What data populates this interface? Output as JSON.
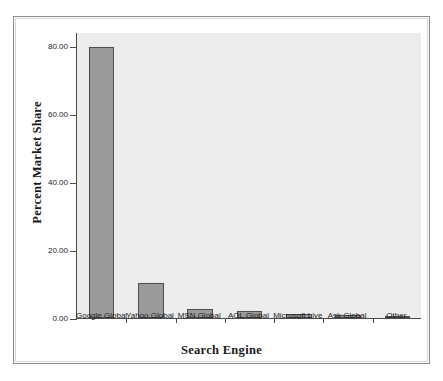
{
  "chart_data": {
    "type": "bar",
    "title": "",
    "xlabel": "Search Engine",
    "ylabel": "Percent Market Share",
    "categories": [
      "Google Global",
      "Yahoo Global",
      "MSN Global",
      "AOL Global",
      "Microsoft Live",
      "Ask Global",
      "Other"
    ],
    "values": [
      79.6,
      10.4,
      2.7,
      2.0,
      1.1,
      0.9,
      0.2
    ],
    "ylim": [
      0,
      84
    ],
    "yticks": [
      0,
      20,
      40,
      60,
      80
    ],
    "ytick_labels": [
      "0.00",
      "20.00",
      "40.00",
      "60.00",
      "80.00"
    ],
    "grid": false,
    "legend": false,
    "bar_color": "#9a9a9a",
    "bar_edge_color": "#4d4d4d",
    "plot_background": "#ececec",
    "figure_background": "#ffffff",
    "axis_color": "#4a4a4a"
  }
}
